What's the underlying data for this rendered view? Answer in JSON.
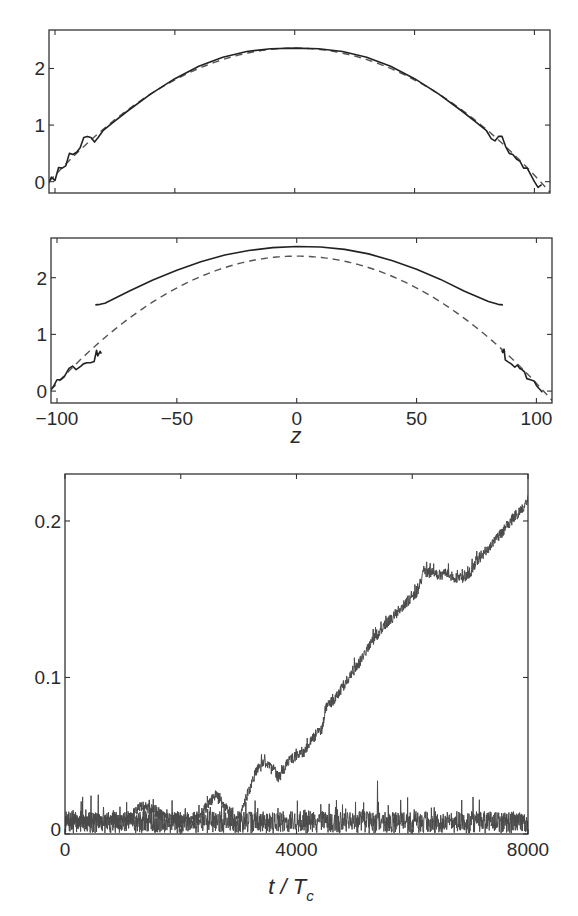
{
  "chart_data": [
    {
      "id": "panel-a",
      "type": "line",
      "title": "",
      "xlabel": "",
      "ylabel": "",
      "xlim": [
        -102.5,
        106.5
      ],
      "ylim": [
        -0.2,
        2.68
      ],
      "frame_px": {
        "left": 49,
        "top": 30,
        "right": 550,
        "bottom": 193
      },
      "xticks": [
        -100,
        -50,
        0,
        50,
        100
      ],
      "xtick_labels_visible": false,
      "yticks": [
        0,
        1,
        2
      ],
      "ytick_labels": [
        "0",
        "1",
        "2"
      ],
      "grid": false,
      "series": [
        {
          "name": "dashed-parabola",
          "style": "dashed",
          "color": "#555555",
          "parabola": {
            "peak": 2.36,
            "center": 0,
            "half_width": 102.5
          }
        },
        {
          "name": "solid-profile",
          "style": "solid",
          "color": "#222222",
          "x": [
            -103,
            -101.5,
            -100,
            -98.5,
            -97,
            -95.5,
            -94,
            -92.5,
            -91,
            -89.5,
            -88,
            -86.5,
            -85,
            -83.5,
            -82,
            -80,
            -76,
            -70,
            -60,
            -50,
            -40,
            -30,
            -20,
            -10,
            0,
            10,
            20,
            30,
            40,
            50,
            60,
            70,
            76,
            80,
            82,
            83.5,
            85,
            86.5,
            88,
            89.5,
            91,
            92.5,
            94,
            95.5,
            97,
            98.5,
            100,
            101.5,
            103
          ],
          "y": [
            -0.05,
            0.08,
            0.02,
            0.25,
            0.24,
            0.28,
            0.5,
            0.48,
            0.52,
            0.6,
            0.78,
            0.8,
            0.78,
            0.7,
            0.78,
            0.9,
            1.04,
            1.24,
            1.55,
            1.82,
            2.04,
            2.2,
            2.3,
            2.35,
            2.36,
            2.35,
            2.3,
            2.2,
            2.04,
            1.82,
            1.55,
            1.24,
            1.04,
            0.9,
            0.76,
            0.72,
            0.8,
            0.8,
            0.62,
            0.5,
            0.48,
            0.4,
            0.36,
            0.24,
            0.24,
            0.12,
            0.0,
            -0.1,
            -0.05
          ]
        }
      ]
    },
    {
      "id": "panel-b",
      "type": "line",
      "title": "",
      "xlabel": "z",
      "ylabel": "",
      "xlim": [
        -102.5,
        106.5
      ],
      "ylim": [
        -0.21,
        2.7
      ],
      "frame_px": {
        "left": 51,
        "top": 238,
        "right": 552,
        "bottom": 403
      },
      "xticks": [
        -100,
        -50,
        0,
        50,
        100
      ],
      "xtick_labels": [
        "−100",
        "−50",
        "0",
        "50",
        "100"
      ],
      "yticks": [
        0,
        1,
        2
      ],
      "ytick_labels": [
        "0",
        "1",
        "2"
      ],
      "grid": false,
      "series": [
        {
          "name": "dashed-parabola",
          "style": "dashed",
          "color": "#555555",
          "parabola": {
            "peak": 2.38,
            "center": 0,
            "half_width": 103
          }
        },
        {
          "name": "solid-upper-arc",
          "style": "solid",
          "color": "#222222",
          "x": [
            -84,
            -82,
            -80,
            -70,
            -60,
            -50,
            -40,
            -30,
            -20,
            -10,
            0,
            10,
            20,
            30,
            40,
            50,
            60,
            70,
            80,
            84,
            86
          ],
          "y": [
            1.52,
            1.53,
            1.55,
            1.76,
            1.96,
            2.13,
            2.28,
            2.4,
            2.48,
            2.53,
            2.55,
            2.54,
            2.5,
            2.42,
            2.3,
            2.15,
            1.97,
            1.76,
            1.58,
            1.53,
            1.52
          ]
        },
        {
          "name": "solid-left-edge",
          "style": "solid",
          "color": "#222222",
          "x": [
            -103,
            -101.5,
            -100,
            -98.5,
            -97,
            -95,
            -93.5,
            -92,
            -90,
            -89,
            -87.5,
            -86,
            -84.5,
            -83.5,
            -83,
            -82,
            -81.5
          ],
          "y": [
            0.0,
            0.08,
            0.2,
            0.2,
            0.25,
            0.4,
            0.44,
            0.38,
            0.44,
            0.48,
            0.5,
            0.5,
            0.52,
            0.72,
            0.62,
            0.7,
            0.66
          ]
        },
        {
          "name": "solid-right-edge",
          "style": "solid",
          "color": "#222222",
          "x": [
            85.5,
            86,
            86.5,
            87,
            88,
            89.5,
            91,
            92,
            93,
            94,
            95,
            96,
            97.5,
            99,
            100,
            101,
            102.5
          ],
          "y": [
            0.72,
            0.68,
            0.74,
            0.55,
            0.52,
            0.48,
            0.42,
            0.46,
            0.4,
            0.38,
            0.34,
            0.22,
            0.2,
            0.18,
            0.1,
            0.05,
            -0.02
          ]
        }
      ]
    },
    {
      "id": "panel-c",
      "type": "line",
      "title": "",
      "xlabel": "t / T",
      "xlabel_subscript": "c",
      "ylabel": "",
      "xlim": [
        0,
        8000
      ],
      "ylim": [
        0,
        0.23
      ],
      "frame_px": {
        "left": 65,
        "top": 474,
        "right": 528,
        "bottom": 834
      },
      "xticks": [
        0,
        2000,
        4000,
        6000,
        8000
      ],
      "xtick_labels": [
        "0",
        "",
        "4000",
        "",
        "8000"
      ],
      "yticks": [
        0,
        0.1,
        0.2
      ],
      "ytick_labels": [
        "0",
        "0.1",
        "0.2"
      ],
      "grid": false,
      "series": [
        {
          "name": "baseline-noise",
          "style": "solid",
          "color": "#4a4a4a",
          "noise": {
            "mean": 0.0075,
            "amplitude": 0.007,
            "spikes": [
              [
                5400,
                0.034
              ]
            ],
            "seed": 7
          },
          "x": [
            0,
            1000,
            2000,
            3000,
            4000,
            5000,
            6000,
            7000,
            8000
          ],
          "y": [
            0.0075,
            0.0075,
            0.0075,
            0.0075,
            0.0075,
            0.0075,
            0.0075,
            0.0075,
            0.0075
          ]
        },
        {
          "name": "growing-signal",
          "style": "solid",
          "color": "#4a4a4a",
          "noise": {
            "amplitude": 0.0035,
            "seed": 13
          },
          "x": [
            0,
            1100,
            1300,
            1500,
            1800,
            2300,
            2500,
            2600,
            2750,
            2950,
            3050,
            3150,
            3300,
            3450,
            3600,
            3700,
            3850,
            4000,
            4150,
            4300,
            4450,
            4500,
            4700,
            4900,
            5100,
            5300,
            5500,
            5700,
            5900,
            6100,
            6200,
            6400,
            6600,
            6800,
            7000,
            7100,
            7300,
            7500,
            7700,
            7900,
            8000
          ],
          "y": [
            0.008,
            0.009,
            0.018,
            0.016,
            0.009,
            0.01,
            0.02,
            0.025,
            0.018,
            0.01,
            0.015,
            0.025,
            0.04,
            0.046,
            0.04,
            0.036,
            0.046,
            0.05,
            0.053,
            0.062,
            0.068,
            0.08,
            0.088,
            0.1,
            0.11,
            0.123,
            0.132,
            0.14,
            0.148,
            0.155,
            0.168,
            0.166,
            0.166,
            0.163,
            0.166,
            0.174,
            0.182,
            0.19,
            0.2,
            0.208,
            0.214
          ]
        }
      ]
    }
  ]
}
